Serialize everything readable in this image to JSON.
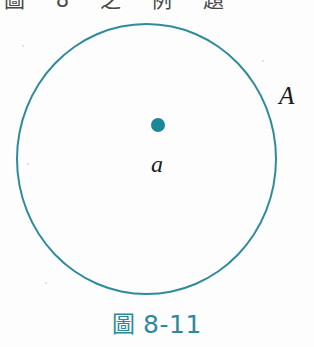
{
  "figure": {
    "caption_word": "圖",
    "caption_number": "8-11",
    "caption_full": "圖 8-11",
    "top_clipped_text": "圖 8 之 例 題",
    "colors": {
      "teal_stroke": "#2d8b9b",
      "teal_fill": "#1d8798",
      "caption_teal": "#2e8a9a",
      "label_black": "#1a1a1a",
      "paper": "#fdfdfd"
    }
  },
  "diagram": {
    "type": "venn-set-diagram",
    "set_label": "A",
    "element_label": "a",
    "circle": {
      "name": "set-a-boundary",
      "center_x": 146,
      "center_y": 159,
      "radius_x": 130,
      "radius_y": 136,
      "stroke_width": 2
    },
    "point": {
      "name": "element-a",
      "x": 158,
      "y": 125,
      "radius": 7
    },
    "labels": [
      {
        "text": "A",
        "role": "set-name",
        "x": 285,
        "y": 95
      },
      {
        "text": "a",
        "role": "element-name",
        "x": 158,
        "y": 165
      }
    ]
  }
}
